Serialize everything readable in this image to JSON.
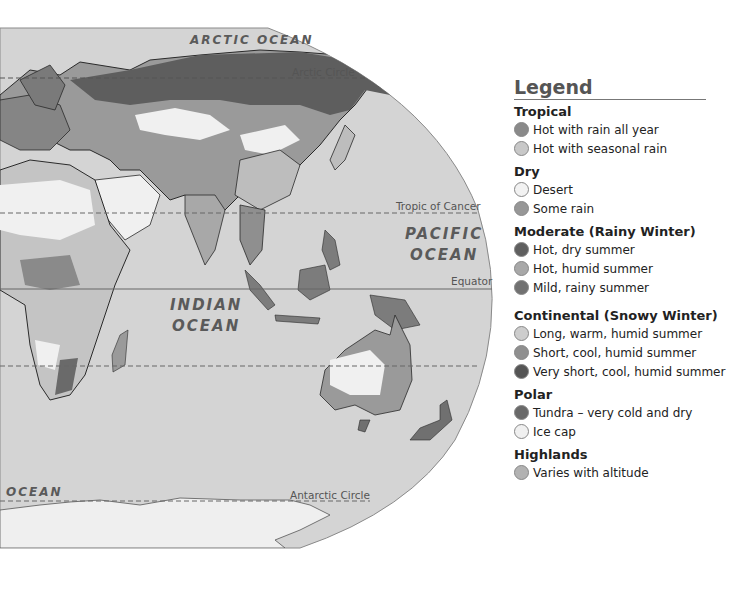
{
  "map": {
    "ocean_labels": {
      "arctic": "ARCTIC OCEAN",
      "pacific_line1": "PACIFIC",
      "pacific_line2": "OCEAN",
      "indian_line1": "INDIAN",
      "indian_line2": "OCEAN",
      "atlantic_partial": "OCEAN"
    },
    "line_labels": {
      "arctic_circle": "Arctic Circle",
      "tropic_of_cancer": "Tropic of Cancer",
      "equator": "Equator",
      "antarctic_circle": "Antarctic Circle"
    },
    "colors": {
      "ocean": "#d4d4d4",
      "ice_cap": "#efefef",
      "desert": "#f0f0f0",
      "tundra": "#707070",
      "subarctic": "#5e5e5e",
      "humid_continental": "#9a9a9a",
      "warm_humid": "#bdbdbd",
      "border": "#2a2a2a"
    }
  },
  "legend": {
    "title": "Legend",
    "groups": [
      {
        "title": "Tropical",
        "items": [
          {
            "label": "Hot with rain all year",
            "color": "#8a8a8a"
          },
          {
            "label": "Hot with seasonal rain",
            "color": "#c8c8c8"
          }
        ]
      },
      {
        "title": "Dry",
        "items": [
          {
            "label": "Desert",
            "color": "#f2f2f2"
          },
          {
            "label": "Some rain",
            "color": "#979797"
          }
        ]
      },
      {
        "title": "Moderate (Rainy Winter)",
        "items": [
          {
            "label": "Hot, dry summer",
            "color": "#5f5f5f"
          },
          {
            "label": "Hot, humid summer",
            "color": "#a8a8a8"
          },
          {
            "label": "Mild, rainy summer",
            "color": "#717171"
          }
        ]
      },
      {
        "title": "Continental (Snowy Winter)",
        "items": [
          {
            "label": "Long, warm, humid summer",
            "color": "#cdcdcd"
          },
          {
            "label": "Short, cool, humid summer",
            "color": "#8f8f8f"
          },
          {
            "label": "Very short, cool, humid summer",
            "color": "#555555"
          }
        ]
      },
      {
        "title": "Polar",
        "items": [
          {
            "label": "Tundra – very cold and dry",
            "color": "#696969"
          },
          {
            "label": "Ice cap",
            "color": "#f0f0f0"
          }
        ]
      },
      {
        "title": "Highlands",
        "items": [
          {
            "label": "Varies with altitude",
            "color": "#b2b2b2"
          }
        ]
      }
    ]
  }
}
